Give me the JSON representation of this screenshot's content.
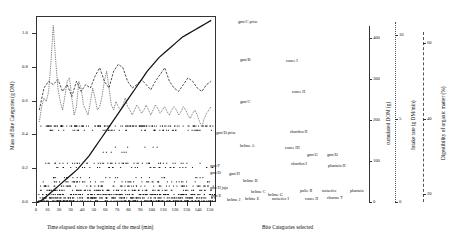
{
  "axes": {
    "left": {
      "title": "Mass of Bite Categories (g DM)",
      "ticks": [
        "0.0",
        "0.2",
        "0.4",
        "0.6",
        "0.8",
        "1.0"
      ],
      "min": 0.0,
      "max": 1.1
    },
    "bottom": {
      "title": "Time elapsed since the begining of the meal (min)",
      "ticks": [
        "0",
        "10",
        "20",
        "30",
        "40",
        "50",
        "60",
        "70",
        "80",
        "90",
        "100",
        "110",
        "120",
        "130",
        "140",
        "150"
      ],
      "min": 0,
      "max": 155
    },
    "bottom_right": {
      "title": "Bite Categories selected"
    },
    "right_1": {
      "title": "cumulated DOM (g)",
      "ticks": [
        "0",
        "100",
        "200",
        "300",
        "400"
      ],
      "min": 0,
      "max": 430
    },
    "right_2": {
      "title": "Intake rate (g DM/min)",
      "ticks": [
        "0",
        "5",
        "10"
      ],
      "min": 0,
      "max": 10.8
    },
    "right_3": {
      "title": "Digestibility of organic matter (%)",
      "ticks": [
        "20",
        "40",
        "60"
      ],
      "min": 18,
      "max": 63
    }
  },
  "bite_labels": [
    {
      "text": "gmt/C prise",
      "x": 238,
      "y": 19
    },
    {
      "text": "gmt/B",
      "x": 240,
      "y": 57
    },
    {
      "text": "gmt/C",
      "x": 240,
      "y": 99
    },
    {
      "text": "ronce I",
      "x": 286,
      "y": 58
    },
    {
      "text": "ronce II",
      "x": 292,
      "y": 89
    },
    {
      "text": "gmt/D prise",
      "x": 216,
      "y": 130
    },
    {
      "text": "chardon II",
      "x": 290,
      "y": 129
    },
    {
      "text": "brôme A",
      "x": 240,
      "y": 143
    },
    {
      "text": "ronce III",
      "x": 285,
      "y": 145
    },
    {
      "text": "gmt/G",
      "x": 307,
      "y": 152
    },
    {
      "text": "gmt/D",
      "x": 327,
      "y": 152
    },
    {
      "text": "gmt/F",
      "x": 210,
      "y": 163
    },
    {
      "text": "chardon I",
      "x": 291,
      "y": 161
    },
    {
      "text": "plantain II",
      "x": 328,
      "y": 163
    },
    {
      "text": "gmt/D",
      "x": 210,
      "y": 170
    },
    {
      "text": "gmt/H",
      "x": 229,
      "y": 171
    },
    {
      "text": "brôme B",
      "x": 243,
      "y": 178
    },
    {
      "text": "gmt/H jaja",
      "x": 210,
      "y": 185
    },
    {
      "text": "brôme C",
      "x": 251,
      "y": 189
    },
    {
      "text": "gmt/E",
      "x": 211,
      "y": 193
    },
    {
      "text": "brôme G",
      "x": 268,
      "y": 192
    },
    {
      "text": "pulie II",
      "x": 300,
      "y": 188
    },
    {
      "text": "noisetier",
      "x": 322,
      "y": 188
    },
    {
      "text": "plantain",
      "x": 350,
      "y": 188
    },
    {
      "text": "brôme J",
      "x": 227,
      "y": 197
    },
    {
      "text": "brôme E",
      "x": 245,
      "y": 196
    },
    {
      "text": "noisetier I",
      "x": 272,
      "y": 196
    },
    {
      "text": "ronce II",
      "x": 305,
      "y": 196
    },
    {
      "text": "charme T",
      "x": 327,
      "y": 195
    }
  ],
  "chart_data": {
    "type": "line",
    "title": "",
    "xlabel": "Time elapsed since the begining of the meal (min)",
    "ylabel": "Mass of Bite Categories (g DM)",
    "xlim": [
      0,
      155
    ],
    "ylim": [
      0.0,
      1.1
    ],
    "grid": false,
    "legend": "none",
    "series": [
      {
        "name": "Bite mass (dotted, spiky)",
        "style": "dotted",
        "x": [
          2,
          4,
          6,
          8,
          10,
          12,
          14,
          16,
          18,
          20,
          22,
          24,
          26,
          28,
          30,
          32,
          34,
          36,
          38,
          40,
          42,
          44,
          46,
          48,
          50,
          52,
          54,
          56,
          58,
          60,
          62,
          64,
          66,
          68,
          70,
          72,
          74,
          76,
          78,
          80,
          82,
          84,
          86,
          88,
          90,
          92,
          94,
          96,
          98,
          100,
          102,
          104,
          106,
          108,
          110,
          112,
          114,
          116,
          118,
          120,
          122,
          124,
          126,
          128,
          130,
          132,
          134,
          136,
          138,
          140,
          142,
          144,
          146,
          148,
          150
        ],
        "values": [
          0.48,
          0.57,
          0.62,
          0.6,
          0.66,
          0.83,
          1.05,
          0.85,
          0.68,
          0.6,
          0.55,
          0.63,
          0.72,
          0.74,
          0.62,
          0.52,
          0.57,
          0.72,
          0.68,
          0.58,
          0.55,
          0.52,
          0.6,
          0.68,
          0.62,
          0.55,
          0.57,
          0.63,
          0.72,
          0.78,
          0.68,
          0.58,
          0.55,
          0.6,
          0.57,
          0.55,
          0.58,
          0.62,
          0.57,
          0.55,
          0.52,
          0.55,
          0.58,
          0.56,
          0.53,
          0.55,
          0.58,
          0.55,
          0.52,
          0.55,
          0.58,
          0.56,
          0.53,
          0.55,
          0.57,
          0.54,
          0.52,
          0.55,
          0.57,
          0.55,
          0.52,
          0.54,
          0.57,
          0.55,
          0.52,
          0.5,
          0.53,
          0.55,
          0.52,
          0.48,
          0.45,
          0.5,
          0.53,
          0.55,
          0.57
        ]
      },
      {
        "name": "Intake rate (dashed)",
        "style": "dashed",
        "x": [
          2,
          6,
          10,
          14,
          18,
          22,
          26,
          30,
          34,
          38,
          42,
          46,
          50,
          54,
          58,
          62,
          66,
          70,
          74,
          78,
          82,
          86,
          90,
          94,
          98,
          102,
          106,
          110,
          114,
          118,
          122,
          126,
          130,
          134,
          138,
          142,
          146,
          150
        ],
        "values": [
          0.55,
          0.68,
          0.72,
          0.7,
          0.73,
          0.66,
          0.7,
          0.63,
          0.72,
          0.66,
          0.7,
          0.68,
          0.75,
          0.8,
          0.72,
          0.68,
          0.78,
          0.82,
          0.8,
          0.72,
          0.68,
          0.7,
          0.73,
          0.7,
          0.67,
          0.72,
          0.76,
          0.8,
          0.72,
          0.68,
          0.66,
          0.7,
          0.74,
          0.72,
          0.68,
          0.66,
          0.7,
          0.72
        ]
      },
      {
        "name": "Cumulated DOM (solid)",
        "style": "solid",
        "x": [
          0,
          5,
          10,
          15,
          20,
          25,
          30,
          35,
          40,
          45,
          50,
          55,
          60,
          65,
          70,
          75,
          80,
          85,
          90,
          95,
          100,
          105,
          110,
          115,
          120,
          125,
          130,
          135,
          140,
          145,
          150
        ],
        "values": [
          0.0,
          0.02,
          0.05,
          0.08,
          0.11,
          0.14,
          0.17,
          0.2,
          0.24,
          0.28,
          0.33,
          0.38,
          0.43,
          0.48,
          0.53,
          0.58,
          0.63,
          0.68,
          0.73,
          0.78,
          0.82,
          0.86,
          0.89,
          0.92,
          0.95,
          0.98,
          1.0,
          1.02,
          1.04,
          1.06,
          1.08
        ]
      }
    ]
  }
}
